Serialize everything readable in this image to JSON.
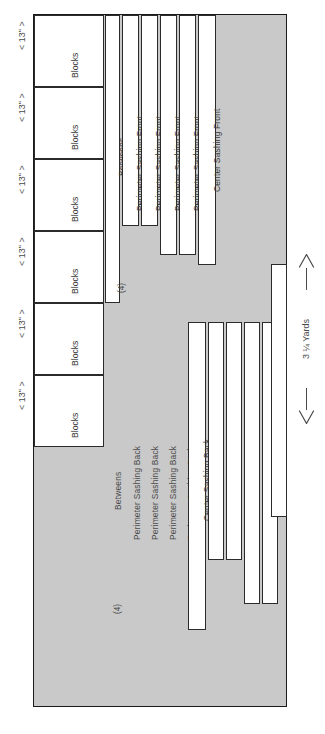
{
  "diagram": {
    "fabric_color": "#c9c9c9",
    "line_color": "#2b2b2b",
    "yardage_label": "3 ¼ Yards",
    "quantity_badge": "(4)"
  },
  "left_dimensions": [
    {
      "label": "< 13\" >"
    },
    {
      "label": "< 13\" >"
    },
    {
      "label": "< 13\" >"
    },
    {
      "label": "< 13\" >"
    },
    {
      "label": "< 13\" >"
    },
    {
      "label": "< 13\" >"
    }
  ],
  "blocks": [
    {
      "label": "Blocks"
    },
    {
      "label": "Blocks"
    },
    {
      "label": "Blocks"
    },
    {
      "label": "Blocks"
    },
    {
      "label": "Blocks"
    },
    {
      "label": "Blocks"
    }
  ],
  "upper_strips": [
    {
      "label": "Betweens",
      "qty": "(4)"
    },
    {
      "label": "Perimeter Sashing Front",
      "qty": ""
    },
    {
      "label": "Perimeter Sashing Front",
      "qty": ""
    },
    {
      "label": "Perimeter Sashing Front",
      "qty": ""
    },
    {
      "label": "Perimeter Sashing Front",
      "qty": ""
    },
    {
      "label": "Center Sashing Front",
      "qty": ""
    }
  ],
  "lower_strips": [
    {
      "label": "Betweens",
      "qty": "(4)"
    },
    {
      "label": "Perimeter Sashing Back",
      "qty": ""
    },
    {
      "label": "Perimeter Sashing Back",
      "qty": ""
    },
    {
      "label": "Perimeter Sashing Back",
      "qty": ""
    },
    {
      "label": "Perimeter Sashing Back",
      "qty": ""
    },
    {
      "label": "Center Sashing Back",
      "qty": ""
    }
  ]
}
